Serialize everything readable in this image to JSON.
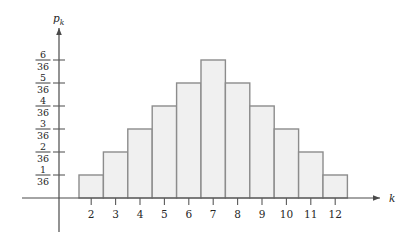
{
  "chart_data": {
    "type": "bar",
    "title": "",
    "subtitle": "",
    "xlabel": "k",
    "ylabel": "p_k",
    "categories": [
      "2",
      "3",
      "4",
      "5",
      "6",
      "7",
      "8",
      "9",
      "10",
      "11",
      "12"
    ],
    "values": [
      1,
      2,
      3,
      4,
      5,
      6,
      5,
      4,
      3,
      2,
      1
    ],
    "value_labels": [
      "1/36",
      "2/36",
      "3/36",
      "4/36",
      "5/36",
      "6/36",
      "5/36",
      "4/36",
      "3/36",
      "2/36",
      "1/36"
    ],
    "value_denominator": 36,
    "ylim": [
      0,
      6.6
    ],
    "xlim": [
      1.5,
      12.5
    ],
    "grid": false,
    "legend": null,
    "y_ticks": [
      {
        "value": 1,
        "numerator": "1",
        "denominator": "36"
      },
      {
        "value": 2,
        "numerator": "2",
        "denominator": "36"
      },
      {
        "value": 3,
        "numerator": "3",
        "denominator": "36"
      },
      {
        "value": 4,
        "numerator": "4",
        "denominator": "36"
      },
      {
        "value": 5,
        "numerator": "5",
        "denominator": "36"
      },
      {
        "value": 6,
        "numerator": "6",
        "denominator": "36"
      }
    ],
    "x_ticks": [
      "2",
      "3",
      "4",
      "5",
      "6",
      "7",
      "8",
      "9",
      "10",
      "11",
      "12"
    ],
    "colors": {
      "bar_fill": "#f0f0f0",
      "bar_stroke": "#8c8c8c",
      "axis": "#4a4a4a",
      "text": "#262626",
      "background": "#ffffff"
    }
  },
  "axes": {
    "y_axis_label_main": "p",
    "y_axis_label_sub": "k",
    "x_axis_label": "k"
  }
}
